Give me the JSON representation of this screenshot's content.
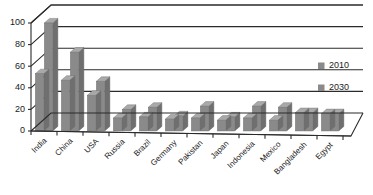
{
  "chart_data": {
    "type": "bar",
    "title": "",
    "subtitle": "",
    "xlabel": "",
    "ylabel": "",
    "ylim": [
      0,
      100
    ],
    "yticks": [
      0,
      20,
      40,
      60,
      80,
      100
    ],
    "grid": true,
    "legend_position": "right",
    "style": "3d-clustered-column",
    "categories": [
      "India",
      "China",
      "USA",
      "Russia",
      "Brazil",
      "Germany",
      "Pakistan",
      "Japan",
      "Indonesia",
      "Mexico",
      "Bangladesh",
      "Egypt"
    ],
    "series": [
      {
        "name": "2010",
        "color": "#8a8a8a",
        "values": [
          53,
          47,
          33,
          12,
          13,
          11,
          12,
          10,
          12,
          10,
          17,
          16
        ]
      },
      {
        "name": "2030",
        "color": "#8a8a8a",
        "values": [
          100,
          73,
          46,
          20,
          22,
          14,
          23,
          13,
          23,
          22,
          17,
          16
        ]
      }
    ]
  },
  "axis": {
    "tick_labels": [
      "0",
      "20",
      "40",
      "60",
      "80",
      "100"
    ]
  },
  "legend": {
    "entries": [
      {
        "label": "2010",
        "swatch_color": "#8a8a8a"
      },
      {
        "label": "2030",
        "swatch_color": "#8a8a8a"
      }
    ]
  },
  "colors": {
    "bar_front": "#8a8a8a",
    "bar_top": "#a9a9a9",
    "bar_side": "#6f6f6f",
    "axis": "#2b2b2b",
    "background": "#ffffff",
    "text": "#1a1a1a"
  }
}
